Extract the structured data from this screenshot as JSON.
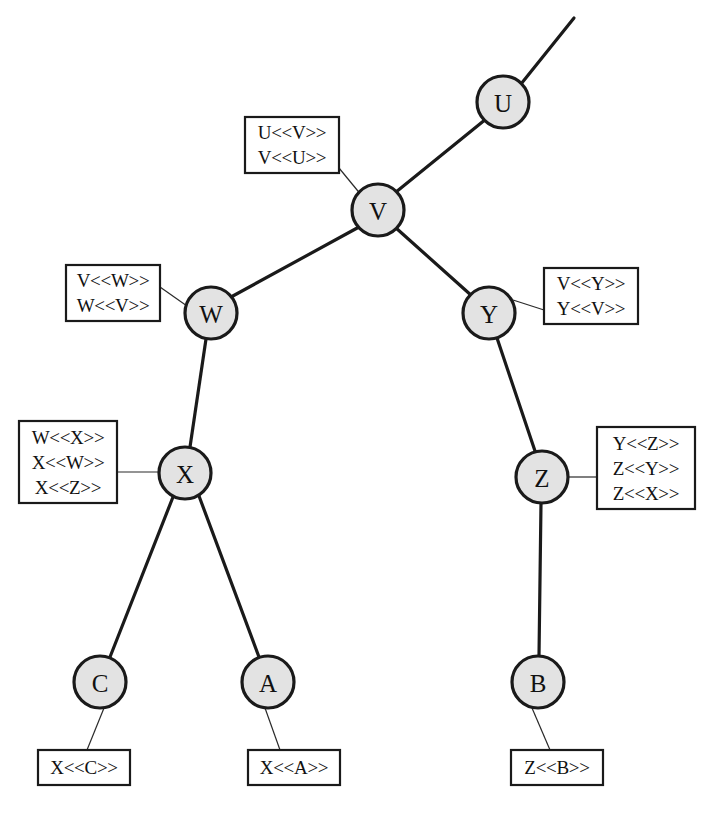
{
  "diagram": {
    "canvas": {
      "width": 709,
      "height": 817
    },
    "style": {
      "node_fill": "#e3e3e3",
      "node_stroke": "#1a1a1a",
      "edge_color": "#1a1a1a",
      "box_fill": "#ffffff",
      "box_stroke": "#1a1a1a",
      "background": "#ffffff"
    },
    "nodes": [
      {
        "id": "U",
        "label": "U",
        "cx": 503,
        "cy": 102,
        "r": 26
      },
      {
        "id": "V",
        "label": "V",
        "cx": 378,
        "cy": 210,
        "r": 26
      },
      {
        "id": "W",
        "label": "W",
        "cx": 211,
        "cy": 313,
        "r": 26
      },
      {
        "id": "Y",
        "label": "Y",
        "cx": 489,
        "cy": 313,
        "r": 26
      },
      {
        "id": "X",
        "label": "X",
        "cx": 185,
        "cy": 473,
        "r": 26
      },
      {
        "id": "Z",
        "label": "Z",
        "cx": 542,
        "cy": 477,
        "r": 26
      },
      {
        "id": "C",
        "label": "C",
        "cx": 100,
        "cy": 682,
        "r": 26
      },
      {
        "id": "A",
        "label": "A",
        "cx": 268,
        "cy": 682,
        "r": 26
      },
      {
        "id": "B",
        "label": "B",
        "cx": 538,
        "cy": 682,
        "r": 26
      }
    ],
    "edges": [
      {
        "from": "U",
        "to": "upper-right-open",
        "x1": 521,
        "y1": 84,
        "x2": 574,
        "y2": 18
      },
      {
        "from": "V",
        "to": "U",
        "x1": 396,
        "y1": 192,
        "x2": 486,
        "y2": 119
      },
      {
        "from": "V",
        "to": "W",
        "x1": 359,
        "y1": 227,
        "x2": 231,
        "y2": 297
      },
      {
        "from": "V",
        "to": "Y",
        "x1": 396,
        "y1": 228,
        "x2": 472,
        "y2": 296
      },
      {
        "from": "W",
        "to": "X",
        "x1": 206,
        "y1": 339,
        "x2": 190,
        "y2": 447
      },
      {
        "from": "Y",
        "to": "Z",
        "x1": 497,
        "y1": 338,
        "x2": 535,
        "y2": 451
      },
      {
        "from": "X",
        "to": "C",
        "x1": 173,
        "y1": 497,
        "x2": 110,
        "y2": 657
      },
      {
        "from": "X",
        "to": "A",
        "x1": 199,
        "y1": 496,
        "x2": 259,
        "y2": 657
      },
      {
        "from": "Z",
        "to": "B",
        "x1": 541,
        "y1": 503,
        "x2": 539,
        "y2": 656
      }
    ],
    "annotations": [
      {
        "id": "anno-V",
        "for_node": "V",
        "lines": [
          "U<<V>>",
          "V<<U>>"
        ],
        "box": {
          "x": 245,
          "y": 117,
          "width": 94,
          "height": 56
        },
        "leader": {
          "x1": 339,
          "y1": 168,
          "x2": 362,
          "y2": 196
        }
      },
      {
        "id": "anno-W",
        "for_node": "W",
        "lines": [
          "V<<W>>",
          "W<<V>>"
        ],
        "box": {
          "x": 66,
          "y": 265,
          "width": 94,
          "height": 56
        },
        "leader": {
          "x1": 160,
          "y1": 287,
          "x2": 187,
          "y2": 306
        }
      },
      {
        "id": "anno-Y",
        "for_node": "Y",
        "lines": [
          "V<<Y>>",
          "Y<<V>>"
        ],
        "box": {
          "x": 544,
          "y": 268,
          "width": 94,
          "height": 56
        },
        "leader": {
          "x1": 544,
          "y1": 310,
          "x2": 513,
          "y2": 300
        }
      },
      {
        "id": "anno-X",
        "for_node": "X",
        "lines": [
          "W<<X>>",
          "X<<W>>",
          "X<<Z>>"
        ],
        "box": {
          "x": 19,
          "y": 421,
          "width": 98,
          "height": 82
        },
        "leader": {
          "x1": 117,
          "y1": 472,
          "x2": 159,
          "y2": 472
        }
      },
      {
        "id": "anno-Z",
        "for_node": "Z",
        "lines": [
          "Y<<Z>>",
          "Z<<Y>>",
          "Z<<X>>"
        ],
        "box": {
          "x": 597,
          "y": 427,
          "width": 98,
          "height": 82
        },
        "leader": {
          "x1": 597,
          "y1": 477,
          "x2": 568,
          "y2": 477
        }
      },
      {
        "id": "anno-C",
        "for_node": "C",
        "lines": [
          "X<<C>>"
        ],
        "box": {
          "x": 38,
          "y": 750,
          "width": 92,
          "height": 35
        },
        "leader": {
          "x1": 87,
          "y1": 750,
          "x2": 104,
          "y2": 708
        }
      },
      {
        "id": "anno-A",
        "for_node": "A",
        "lines": [
          "X<<A>>"
        ],
        "box": {
          "x": 248,
          "y": 750,
          "width": 92,
          "height": 35
        },
        "leader": {
          "x1": 280,
          "y1": 750,
          "x2": 265,
          "y2": 708
        }
      },
      {
        "id": "anno-B",
        "for_node": "B",
        "lines": [
          "Z<<B>>"
        ],
        "box": {
          "x": 511,
          "y": 750,
          "width": 92,
          "height": 35
        },
        "leader": {
          "x1": 550,
          "y1": 750,
          "x2": 532,
          "y2": 708
        }
      }
    ]
  }
}
